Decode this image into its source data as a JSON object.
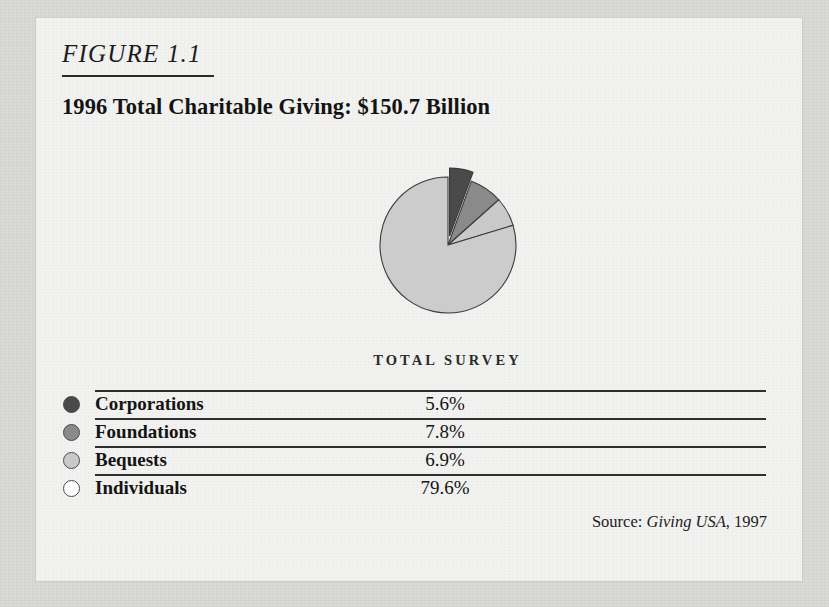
{
  "figure": {
    "label": "FIGURE 1.1",
    "title": "1996 Total Charitable Giving: $150.7 Billion",
    "chart_caption": "TOTAL SURVEY",
    "source_prefix": "Source:",
    "source_publication": "Giving USA",
    "source_year": ", 1997"
  },
  "legend": {
    "rows": [
      {
        "label": "Corporations",
        "value": "5.6%",
        "color": "#4a4a4a"
      },
      {
        "label": "Foundations",
        "value": "7.8%",
        "color": "#8a8a8a"
      },
      {
        "label": "Bequests",
        "value": "6.9%",
        "color": "#c9c9c9"
      },
      {
        "label": "Individuals",
        "value": "79.6%",
        "color": "#ffffff"
      }
    ]
  },
  "chart_data": {
    "type": "pie",
    "title": "1996 Total Charitable Giving: $150.7 Billion",
    "subtitle": "TOTAL SURVEY",
    "total_label": "$150.7 Billion",
    "total_value": 150.7,
    "units": "percent of total giving",
    "legend_position": "below",
    "grid": false,
    "start_angle_deg": 0,
    "direction": "clockwise",
    "exploded_slices": [
      "Corporations"
    ],
    "categories": [
      "Corporations",
      "Foundations",
      "Bequests",
      "Individuals"
    ],
    "values": [
      5.6,
      7.8,
      6.9,
      79.6
    ],
    "colors": [
      "#4a4a4a",
      "#8a8a8a",
      "#c9c9c9",
      "#cccccc"
    ],
    "labels": [
      "5.6%",
      "7.8%",
      "6.9%",
      "79.6%"
    ],
    "source": "Giving USA, 1997"
  }
}
